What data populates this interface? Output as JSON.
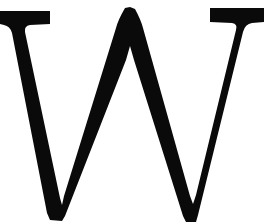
{
  "image": {
    "kind": "scanned-glyph",
    "description": "Capital letter W in a serif (Roman / Times-like) typeface, black ink on white background",
    "character": "W",
    "script": "Latin",
    "case": "uppercase",
    "typeface_style": "serif",
    "stroke_contrast": "high",
    "width_px": 264,
    "height_px": 223,
    "alt_text": "W"
  },
  "colors": {
    "ink": "#0a0a0a",
    "background": "#ffffff",
    "edge_antialias": "#8c8c8c"
  },
  "geometry": {
    "left_serif": {
      "x_start": 0,
      "x_end": 50,
      "y_top": 11,
      "y_bottom": 24
    },
    "right_serif": {
      "x_start": 210,
      "x_end": 264,
      "y_top": 8,
      "y_bottom": 22
    },
    "middle_apex": {
      "x_start": 125,
      "x_end": 135,
      "y_top": 7
    },
    "first_vertex": {
      "x_start": 45,
      "x_end": 62,
      "y_bottom": 220
    },
    "second_vertex": {
      "x_start": 183,
      "x_end": 198,
      "y_bottom": 222
    },
    "clipped_edges": [
      "left",
      "right",
      "bottom"
    ]
  },
  "labels": {
    "canvas": "glyph canvas",
    "glyph": "letter W glyph",
    "caption": "W"
  }
}
